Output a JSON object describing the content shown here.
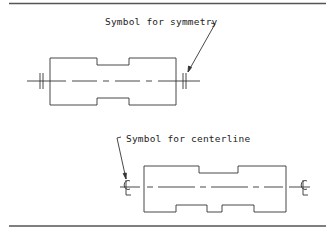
{
  "figure": {
    "top_rule": true,
    "bottom_rule": true,
    "line_color": "#333333",
    "rule_color": "#555555"
  },
  "upper_view": {
    "label": "Symbol for symmetry",
    "symbol": "symmetry-mark",
    "symbol_description": "double short parallel lines across the centerline at each end"
  },
  "lower_view": {
    "label": "Symbol for centerline",
    "symbol": "centerline-mark",
    "symbol_glyph": "℄",
    "symbol_description": "C-L centerline symbol at each end of the centerline"
  }
}
